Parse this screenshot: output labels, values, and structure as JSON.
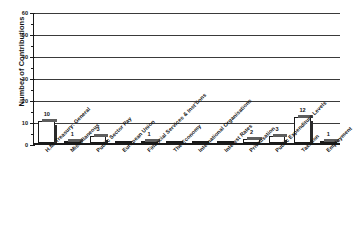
{
  "chart_data": {
    "type": "bar",
    "title": "",
    "xlabel": "",
    "ylabel": "Number of Contributions",
    "ylim": [
      0,
      60
    ],
    "ytick_labels": [
      "0",
      "10",
      "20",
      "30",
      "40",
      "50",
      "60"
    ],
    "ytick_values": [
      0,
      10,
      20,
      30,
      40,
      50,
      60
    ],
    "minor_tick_interval": 5,
    "grid": "horizontal",
    "legend": "none",
    "categories": [
      "H.M. Treasury: General",
      "Miscellaneous",
      "Public Sector Pay",
      "European Union",
      "Financial Services & Inst'tions",
      "The Economy",
      "International Organisations",
      "Interest Rates",
      "Privatisation",
      "Public Expenditure Levels",
      "Taxation",
      "Employment"
    ],
    "values": [
      10,
      1,
      3,
      0,
      1,
      0,
      0,
      0,
      2,
      3,
      12,
      1
    ],
    "value_labels": [
      "10",
      "1",
      "3",
      "",
      "1",
      "",
      "",
      "",
      "2",
      "3",
      "12",
      "1"
    ],
    "colors": {
      "bar_fill": "#ffffff",
      "bar_outline": "#1a1a1a",
      "bar_shadow": "#2a2a2a",
      "grid": "#3a3a3a",
      "axis": "#1a1a1a",
      "text": "#151515",
      "background": "#ffffff"
    }
  }
}
